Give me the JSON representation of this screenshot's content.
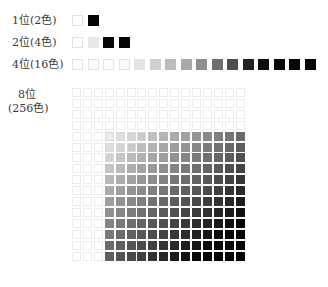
{
  "rows": [
    {
      "label": "1位(2色)",
      "top": 15,
      "pitch": 16,
      "colors": [
        "#ffffff",
        "#050505"
      ]
    },
    {
      "label": "2位(4色)",
      "top": 37,
      "pitch": 15.5,
      "colors": [
        "#ffffff",
        "#e8e8e8",
        "#080808",
        "#050505"
      ]
    },
    {
      "label": "4位(16色)",
      "top": 59,
      "pitch": 15.5,
      "colors": [
        "#ffffff",
        "#fdfdfd",
        "#ffffff",
        "#fbfbfb",
        "#e4e4e4",
        "#cfcfcf",
        "#bcbcbc",
        "#a8a8a8",
        "#8f8f8f",
        "#6e6e6e",
        "#4e4e4e",
        "#222222",
        "#0c0c0c",
        "#070707",
        "#050505",
        "#030303"
      ]
    }
  ],
  "grid": {
    "label_line1": "8位",
    "label_line2": "(256色)",
    "left": 72,
    "top": 88,
    "pitch": 10.9,
    "size": 16
  }
}
